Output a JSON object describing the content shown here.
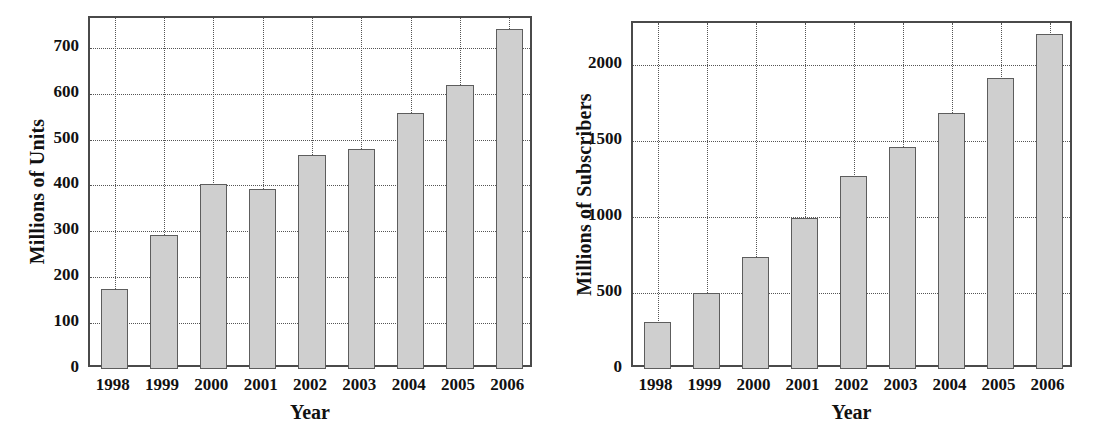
{
  "chart_data": [
    {
      "id": "handset-units",
      "type": "bar",
      "title": "",
      "xlabel": "Year",
      "ylabel": "Millions of Units",
      "categories": [
        "1998",
        "1999",
        "2000",
        "2001",
        "2002",
        "2003",
        "2004",
        "2005",
        "2006"
      ],
      "values": [
        175,
        293,
        403,
        392,
        467,
        480,
        558,
        620,
        742
      ],
      "ylim": [
        0,
        765
      ],
      "yticks": [
        0,
        100,
        200,
        300,
        400,
        500,
        600,
        700
      ],
      "ytick_labels": [
        "0",
        "100",
        "200",
        "300",
        "400",
        "500",
        "600",
        "700"
      ],
      "grid": true,
      "grid_style": "dotted",
      "legend": "none",
      "bar_fill": "#cfcfcf",
      "bar_edge": "#5d5d5d",
      "axis_color": "#4a4a4a"
    },
    {
      "id": "mobile-subscribers",
      "type": "bar",
      "title": "",
      "xlabel": "Year",
      "ylabel": "Millions of Subscribers",
      "categories": [
        "1998",
        "1999",
        "2000",
        "2001",
        "2002",
        "2003",
        "2004",
        "2005",
        "2006"
      ],
      "values": [
        310,
        500,
        740,
        995,
        1270,
        1460,
        1690,
        1920,
        2210
      ],
      "ylim": [
        0,
        2280
      ],
      "yticks": [
        0,
        500,
        1000,
        1500,
        2000
      ],
      "ytick_labels": [
        "0",
        "500",
        "1000",
        "1500",
        "2000"
      ],
      "grid": true,
      "grid_style": "dotted",
      "legend": "none",
      "bar_fill": "#cfcfcf",
      "bar_edge": "#5d5d5d",
      "axis_color": "#4a4a4a"
    }
  ]
}
